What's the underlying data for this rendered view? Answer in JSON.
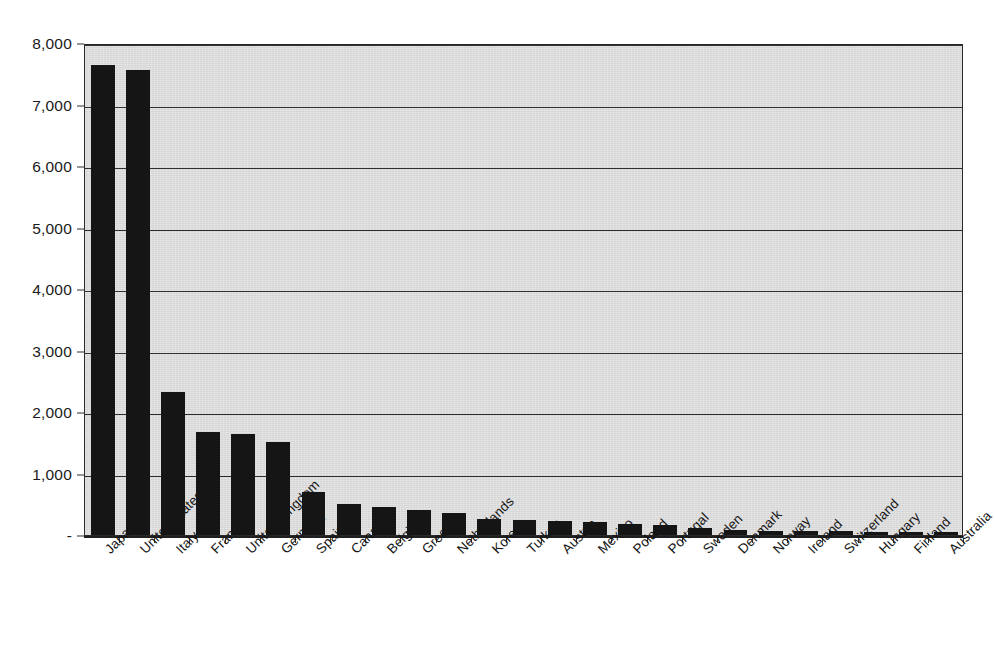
{
  "chart_data": {
    "type": "bar",
    "title": "",
    "subtitle": "",
    "xlabel": "",
    "ylabel": "",
    "ylim": [
      0,
      8000
    ],
    "ytick_values": [
      0,
      1000,
      2000,
      3000,
      4000,
      5000,
      6000,
      7000,
      8000
    ],
    "ytick_labels": [
      "-",
      "1,000",
      "2,000",
      "3,000",
      "4,000",
      "5,000",
      "6,000",
      "7,000",
      "8,000"
    ],
    "grid": true,
    "grid_axis": "y",
    "legend": false,
    "legend_position": "none",
    "bar_color": "#151515",
    "plot_background_color": "#d5d5d5",
    "figure_background_color": "#ffffff",
    "axis_color": "#2f2f2f",
    "xtick_rotation": -45,
    "categories": [
      "Japan",
      "United States",
      "Italy",
      "France",
      "United Kingdom",
      "Germany",
      "Spain",
      "Canada",
      "Belgium",
      "Greece",
      "Netherlands",
      "Korea",
      "Turkey",
      "Austria",
      "Mexico",
      "Poland",
      "Portugal",
      "Sweden",
      "Denmark",
      "Norway",
      "Ireland",
      "Switzerland",
      "Hungary",
      "Finland",
      "Australia"
    ],
    "values": [
      7640,
      7560,
      2330,
      1680,
      1650,
      1520,
      695,
      505,
      450,
      400,
      365,
      260,
      240,
      225,
      205,
      180,
      155,
      120,
      85,
      70,
      65,
      60,
      55,
      55,
      45
    ]
  }
}
